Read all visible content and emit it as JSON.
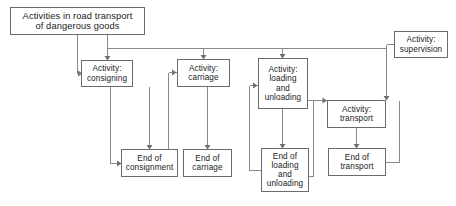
{
  "diagram": {
    "type": "flowchart",
    "title_node": {
      "id": "activities-root",
      "label": "Activities in road transport\nof dangerous goods"
    },
    "nodes": [
      {
        "id": "activity-consigning",
        "label": "Activity:\nconsigning"
      },
      {
        "id": "activity-carriage",
        "label": "Activity:\ncarriage"
      },
      {
        "id": "activity-loading-unloading",
        "label": "Activity:\nloading\nand\nunloading"
      },
      {
        "id": "activity-supervision",
        "label": "Activity:\nsupervision"
      },
      {
        "id": "activity-transport",
        "label": "Activity:\ntransport"
      },
      {
        "id": "end-of-consignment",
        "label": "End of\nconsignment"
      },
      {
        "id": "end-of-carriage",
        "label": "End of\ncarriage"
      },
      {
        "id": "end-of-loading-unloading",
        "label": "End of\nloading\nand\nunloading"
      },
      {
        "id": "end-of-transport",
        "label": "End of\ntransport"
      }
    ],
    "edges": [
      {
        "from": "activities-root",
        "to": "activity-consigning"
      },
      {
        "from": "activities-root",
        "to": "activity-carriage"
      },
      {
        "from": "activities-root",
        "to": "activity-loading-unloading"
      },
      {
        "from": "activities-root",
        "to": "activity-supervision"
      },
      {
        "from": "activity-supervision",
        "to": "activity-transport"
      },
      {
        "from": "activity-consigning",
        "to": "end-of-consignment"
      },
      {
        "from": "activity-carriage",
        "to": "end-of-carriage"
      },
      {
        "from": "activity-loading-unloading",
        "to": "end-of-loading-unloading"
      },
      {
        "from": "activity-loading-unloading",
        "to": "activity-transport"
      },
      {
        "from": "activity-transport",
        "to": "end-of-transport"
      },
      {
        "from": "end-of-consignment",
        "to": "activity-consigning"
      },
      {
        "from": "end-of-carriage",
        "to": "activity-carriage"
      },
      {
        "from": "end-of-loading-unloading",
        "to": "activity-loading-unloading"
      },
      {
        "from": "end-of-transport",
        "to": "activity-loading-unloading"
      }
    ],
    "colors": {
      "box_border": "#6b6b6b",
      "connector": "#8a8a8a",
      "text": "#1a1a1a",
      "background": "#ffffff"
    }
  }
}
